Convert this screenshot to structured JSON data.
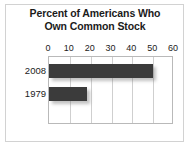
{
  "chart_data": {
    "type": "bar",
    "orientation": "horizontal",
    "title": "Percent of Americans Who Own Common Stock",
    "title_line1": "Percent of Americans Who",
    "title_line2": "Own Common Stock",
    "categories": [
      "2008",
      "1979"
    ],
    "values": [
      50,
      18
    ],
    "xlabel": "",
    "ylabel": "",
    "xlim": [
      0,
      60
    ],
    "xticks": [
      0,
      10,
      20,
      30,
      40,
      50,
      60
    ],
    "xtick_labels": [
      "0",
      "10",
      "20",
      "30",
      "40",
      "50",
      "60"
    ],
    "grid": true,
    "legend": false,
    "bar_color": "#3b3b3b",
    "plot_border_color": "#b9b9b9",
    "gridline_color": "#cfcfcf",
    "frame_color": "#d2d2d2",
    "background": "#ffffff",
    "text_color": "#1b1b1b"
  }
}
